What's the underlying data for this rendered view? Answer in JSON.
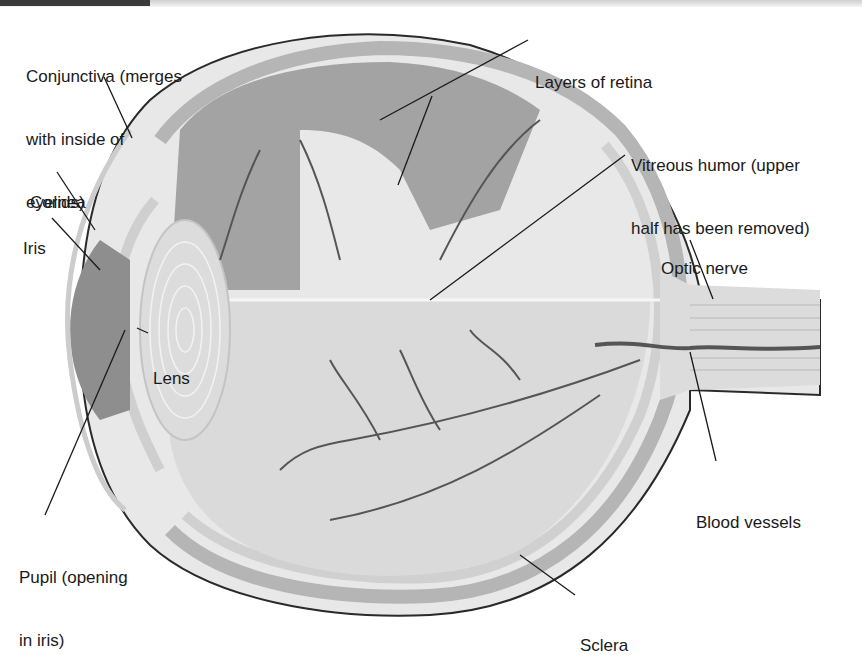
{
  "diagram": {
    "labels": [
      {
        "id": "conjunctiva",
        "lines": [
          "Conjunctiva (merges",
          "with inside of",
          "eyelids)"
        ],
        "x": 26,
        "y": 24
      },
      {
        "id": "layers-of-retina",
        "lines": [
          "Layers of retina"
        ],
        "x": 535,
        "y": 30
      },
      {
        "id": "cornea",
        "lines": [
          "Cornea"
        ],
        "x": 30,
        "y": 150
      },
      {
        "id": "vitreous-humor",
        "lines": [
          "Vitreous humor (upper",
          "half has been removed)"
        ],
        "x": 631,
        "y": 113
      },
      {
        "id": "iris",
        "lines": [
          "Iris"
        ],
        "x": 23,
        "y": 196
      },
      {
        "id": "optic-nerve",
        "lines": [
          "Optic nerve"
        ],
        "x": 661,
        "y": 216
      },
      {
        "id": "lens",
        "lines": [
          "Lens"
        ],
        "x": 153,
        "y": 326
      },
      {
        "id": "blood-vessels",
        "lines": [
          "Blood vessels"
        ],
        "x": 696,
        "y": 470
      },
      {
        "id": "pupil",
        "lines": [
          "Pupil (opening",
          "in iris)"
        ],
        "x": 19,
        "y": 525
      },
      {
        "id": "sclera",
        "lines": [
          "Sclera"
        ],
        "x": 580,
        "y": 593
      }
    ],
    "colors": {
      "sclera": "#e6e6e6",
      "choroid": "#bdbdbd",
      "retina": "#d4d4d4",
      "vitreous_upper": "#9a9a9a",
      "vitreous_lower": "#d9d9d9",
      "vessel": "#555555",
      "outline": "#2a2a2a",
      "label_text": "#1a1a1a"
    }
  }
}
